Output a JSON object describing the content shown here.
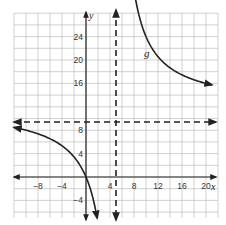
{
  "chart_data": {
    "type": "line",
    "title": "",
    "xlabel": "x",
    "ylabel": "y",
    "xlim": [
      -12,
      22
    ],
    "ylim": [
      -7,
      28
    ],
    "grid": true,
    "grid_step": 2,
    "x_ticks": [
      -8,
      -4,
      4,
      8,
      12,
      16,
      20
    ],
    "y_ticks": [
      24,
      20,
      16,
      8,
      4,
      -4
    ],
    "x_tick_labels": [
      "−8",
      "−4",
      "4",
      "8",
      "12",
      "16",
      "20"
    ],
    "y_tick_labels": [
      "24",
      "20",
      "16",
      "8",
      "4",
      "−4"
    ],
    "asymptotes": [
      {
        "type": "vertical",
        "x": 5,
        "style": "dashed"
      },
      {
        "type": "horizontal",
        "y": 12,
        "style": "dashed"
      }
    ],
    "series": [
      {
        "name": "g",
        "function": "g(x) = 12 + 60/(x - 5)",
        "branches": [
          {
            "x": [
              -12,
              -8,
              -4,
              -2,
              0,
              1,
              1.8
            ],
            "y": [
              8.47,
              7.38,
              5.33,
              3.43,
              0,
              -3,
              -6.75
            ]
          },
          {
            "x": [
              7.1,
              8,
              10,
              12,
              16,
              20,
              21
            ],
            "y": [
              40.6,
              32,
              24,
              20.57,
              17.45,
              16,
              15.75
            ]
          }
        ]
      }
    ],
    "annotations": [
      {
        "text": "g",
        "x": 10,
        "y": 20.5
      }
    ]
  },
  "labels": {
    "x_axis": "x",
    "y_axis": "y",
    "curve": "g",
    "x_ticks": [
      "−8",
      "−4",
      "4",
      "8",
      "12",
      "16",
      "20"
    ],
    "y_ticks": [
      "24",
      "20",
      "16",
      "8",
      "4",
      "−4"
    ]
  }
}
